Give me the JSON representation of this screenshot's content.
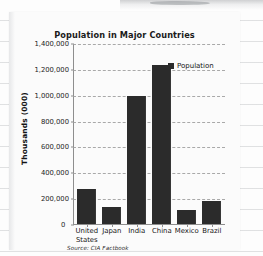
{
  "chart_data": {
    "type": "bar",
    "title": "Population in Major Countries",
    "xlabel": "",
    "ylabel": "Thousands (000)",
    "categories": [
      "United States",
      "Japan",
      "India",
      "China",
      "Mexico",
      "Brazil"
    ],
    "category_lines": [
      [
        "United",
        "States"
      ],
      [
        "Japan"
      ],
      [
        "India"
      ],
      [
        "China"
      ],
      [
        "Mexico"
      ],
      [
        "Brazil"
      ]
    ],
    "series": [
      {
        "name": "Population",
        "values": [
          270000,
          127000,
          985000,
          1230000,
          108000,
          175000
        ]
      }
    ],
    "ylim": [
      0,
      1400000
    ],
    "ytick_values": [
      0,
      200000,
      400000,
      600000,
      800000,
      1000000,
      1200000,
      1400000
    ],
    "ytick_labels": [
      "0",
      "200,000",
      "400,000",
      "600,000",
      "800,000",
      "1,000,000",
      "1,200,000",
      "1,400,000"
    ],
    "grid": true,
    "grid_style": "dashed-horizontal",
    "legend": {
      "position": "top-right",
      "entries": [
        "Population"
      ]
    },
    "bar_color": "#2b2b2b",
    "gridline_color": "#a9a9a9",
    "axis_color": "#8e8e8e"
  },
  "annotations": {
    "source_note": "Source: CIA Factbook"
  }
}
